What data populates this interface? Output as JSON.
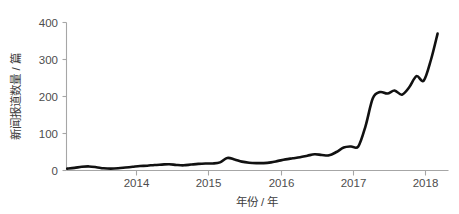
{
  "chart_data": {
    "type": "line",
    "title": "",
    "xlabel": "年份 / 年",
    "ylabel": "新闻报道数量 / 篇",
    "xlim": [
      2013.05,
      2018.3
    ],
    "ylim": [
      0,
      400
    ],
    "grid": false,
    "legend": "none",
    "x_ticks": [
      2014,
      2015,
      2016,
      2017,
      2018
    ],
    "x_tick_labels": [
      "2014",
      "2015",
      "2016",
      "2017",
      "2018"
    ],
    "y_ticks": [
      0,
      100,
      200,
      300,
      400
    ],
    "y_tick_labels": [
      "0",
      "100",
      "200",
      "300",
      "400"
    ],
    "line_color": "#111111",
    "axis_color": "#a6a6a6",
    "series": [
      {
        "name": "新闻报道数量",
        "x": [
          2013.06,
          2013.16,
          2013.26,
          2013.36,
          2013.46,
          2013.56,
          2013.66,
          2013.76,
          2013.86,
          2013.96,
          2014.06,
          2014.16,
          2014.26,
          2014.36,
          2014.46,
          2014.56,
          2014.66,
          2014.76,
          2014.86,
          2014.96,
          2015.06,
          2015.16,
          2015.26,
          2015.36,
          2015.46,
          2015.56,
          2015.66,
          2015.76,
          2015.86,
          2015.96,
          2016.06,
          2016.16,
          2016.26,
          2016.36,
          2016.46,
          2016.56,
          2016.66,
          2016.76,
          2016.86,
          2016.96,
          2017.06,
          2017.16,
          2017.26,
          2017.36,
          2017.46,
          2017.56,
          2017.66,
          2017.76,
          2017.86,
          2017.96,
          2018.06,
          2018.15
        ],
        "y": [
          5,
          7,
          10,
          11,
          9,
          6,
          5,
          6,
          8,
          10,
          12,
          13,
          15,
          16,
          17,
          15,
          14,
          16,
          18,
          19,
          19,
          22,
          34,
          30,
          24,
          21,
          20,
          20,
          22,
          26,
          30,
          33,
          36,
          40,
          44,
          42,
          41,
          50,
          62,
          65,
          65,
          120,
          195,
          212,
          208,
          216,
          205,
          225,
          255,
          243,
          300,
          370
        ]
      }
    ]
  }
}
